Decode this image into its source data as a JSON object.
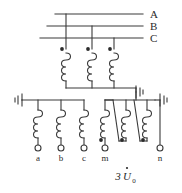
{
  "diagram": {
    "line_color": "#3a3a3a",
    "text_color": "#2b2b2b",
    "background": "#ffffff"
  },
  "phase_lines": [
    {
      "label": "A",
      "y": 14
    },
    {
      "label": "B",
      "y": 26
    },
    {
      "label": "C",
      "y": 38
    }
  ],
  "primary_windings": [
    {
      "name": "winding-a-primary",
      "x": 66,
      "dot": true
    },
    {
      "name": "winding-b-primary",
      "x": 92,
      "dot": true
    },
    {
      "name": "winding-c-primary",
      "x": 114,
      "dot": true
    }
  ],
  "secondary_windings": [
    {
      "name": "winding-a-secondary",
      "x": 38,
      "terminal": "a"
    },
    {
      "name": "winding-b-secondary",
      "x": 61,
      "terminal": "b"
    },
    {
      "name": "winding-c-secondary",
      "x": 84,
      "terminal": "c"
    }
  ],
  "delta_windings": [
    {
      "name": "winding-m-delta",
      "x": 105,
      "terminal": "m",
      "dot": true
    },
    {
      "name": "winding-mid-delta",
      "x": 126,
      "dot": true
    },
    {
      "name": "winding-n-delta",
      "x": 147,
      "terminal": "n",
      "dot": true
    }
  ],
  "terminals": [
    {
      "label": "a",
      "x": 38,
      "y": 158
    },
    {
      "label": "b",
      "x": 61,
      "y": 158
    },
    {
      "label": "c",
      "x": 84,
      "y": 158
    },
    {
      "label": "m",
      "x": 105,
      "y": 158
    },
    {
      "label": "n",
      "x": 160,
      "y": 158
    }
  ],
  "grounds": [
    {
      "name": "ground-primary-neutral",
      "x": 136,
      "y": 92
    },
    {
      "name": "ground-secondary-left",
      "x": 18,
      "y": 104
    },
    {
      "name": "ground-secondary-right",
      "x": 168,
      "y": 104
    }
  ],
  "annotation": {
    "label": "3U̇₀",
    "text": "3",
    "symbol": "U",
    "subscript": "0",
    "x": 122,
    "y": 176
  }
}
